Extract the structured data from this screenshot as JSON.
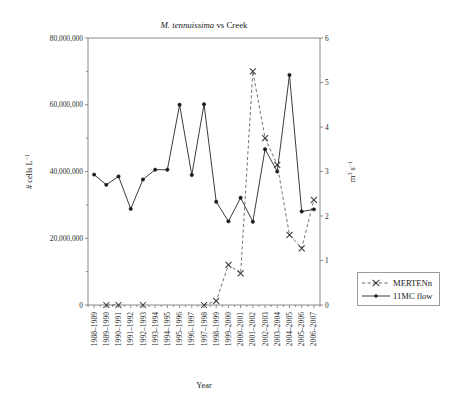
{
  "figure": {
    "title_species": "M. tennuissima",
    "title_rest": " vs Creek",
    "title_full": "M. tennuissima vs Creek"
  },
  "axes": {
    "x_title": "Year",
    "y_left_title": "# cells L",
    "y_left_exponent": "−1",
    "y_right_title": "m",
    "y_right_sup": "3",
    "y_right_unit": " s",
    "y_right_exponent": "−1",
    "y_left_ticks": [
      "0",
      "20,000,000",
      "40,000,000",
      "60,000,000",
      "80,000,000"
    ],
    "y_right_ticks": [
      "0",
      "1",
      "2",
      "3",
      "4",
      "5",
      "6"
    ]
  },
  "legend": {
    "position": "right-bottom",
    "items": [
      {
        "label": "MERTENn",
        "marker": "x-marker",
        "line": "dashed",
        "color": "#5a5a5a"
      },
      {
        "label": "11MC flow",
        "marker": "dot-marker",
        "line": "solid",
        "color": "#262626"
      }
    ]
  },
  "chart_data": {
    "type": "line",
    "title": "M. tennuissima vs Creek",
    "xlabel": "Year",
    "ylabel": "# cells L−1",
    "y2label": "m3 s−1",
    "grid": false,
    "legend_position": "right",
    "ylim": [
      0,
      80000000
    ],
    "y2lim": [
      0,
      6
    ],
    "categories": [
      "1988–1989",
      "1989–1990",
      "1990–1991",
      "1991–1992",
      "1992–1993",
      "1993–1994",
      "1994–1995",
      "1995–1996",
      "1996–1997",
      "1997–1998",
      "1998–1999",
      "1999–2000",
      "2000–2001",
      "2001–2002",
      "2002–2003",
      "2003–2004",
      "2004–2005",
      "2005–2006",
      "2006–2007"
    ],
    "series": [
      {
        "name": "MERTENn",
        "axis": "left",
        "units": "# cells L−1",
        "values": [
          null,
          0,
          0,
          null,
          0,
          null,
          null,
          null,
          null,
          0,
          1200000,
          12000000,
          9500000,
          70000000,
          50000000,
          42000000,
          21000000,
          17000000,
          31500000
        ]
      },
      {
        "name": "11MC flow",
        "axis": "right",
        "units": "m3 s−1",
        "values": [
          2.93,
          2.7,
          2.89,
          2.16,
          2.82,
          3.04,
          3.04,
          4.5,
          2.92,
          4.51,
          2.32,
          1.88,
          2.41,
          1.87,
          3.5,
          3.0,
          5.17,
          2.1,
          2.15
        ]
      }
    ]
  }
}
